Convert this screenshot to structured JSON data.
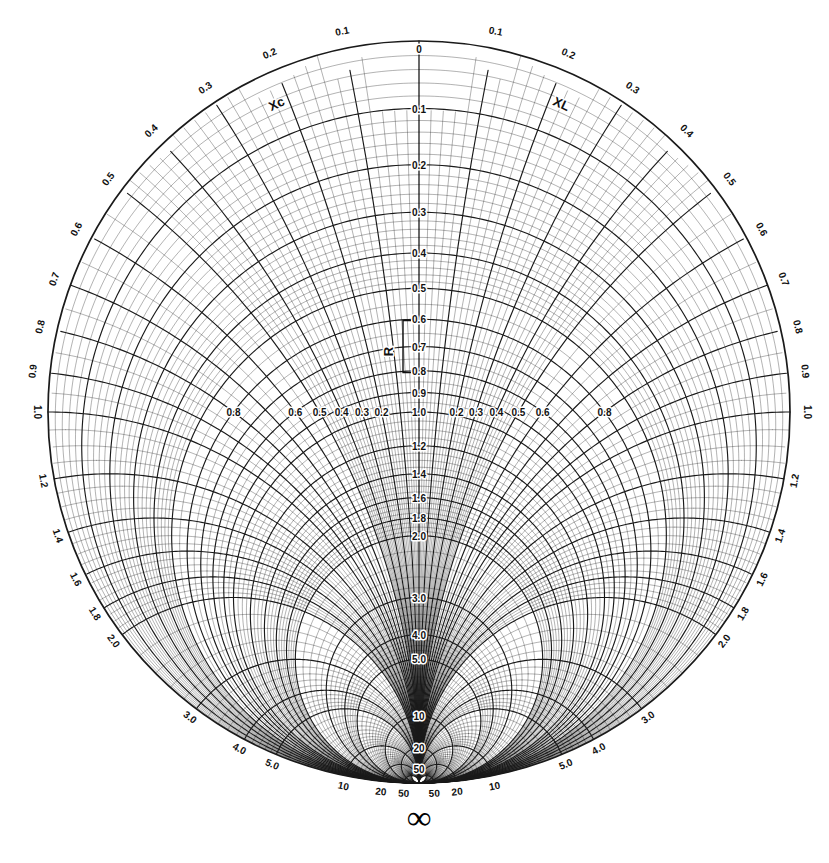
{
  "chart_data": {
    "type": "smith-chart",
    "orientation": "real axis vertical, 0 at top, infinity at bottom",
    "center": {
      "x": 419,
      "y": 412
    },
    "radius": 371,
    "axis_label_real": "R",
    "reactance_label_capacitive": "Xc",
    "reactance_label_inductive": "XL",
    "infinity_symbol": "∞",
    "perimeter_top_label": "0",
    "real_axis_ticks": [
      {
        "value": 0,
        "label": "0"
      },
      {
        "value": 0.1,
        "label": "0.1"
      },
      {
        "value": 0.2,
        "label": "0.2"
      },
      {
        "value": 0.3,
        "label": "0.3"
      },
      {
        "value": 0.4,
        "label": "0.4"
      },
      {
        "value": 0.5,
        "label": "0.5"
      },
      {
        "value": 0.6,
        "label": "0.6"
      },
      {
        "value": 0.7,
        "label": "0.7"
      },
      {
        "value": 0.8,
        "label": "0.8"
      },
      {
        "value": 0.9,
        "label": "0.9"
      },
      {
        "value": 1.0,
        "label": "1.0"
      },
      {
        "value": 1.2,
        "label": "1.2"
      },
      {
        "value": 1.4,
        "label": "1.4"
      },
      {
        "value": 1.6,
        "label": "1.6"
      },
      {
        "value": 1.8,
        "label": "1.8"
      },
      {
        "value": 2.0,
        "label": "2.0"
      },
      {
        "value": 3.0,
        "label": "3.0"
      },
      {
        "value": 4.0,
        "label": "4.0"
      },
      {
        "value": 5.0,
        "label": "5.0"
      },
      {
        "value": 10.0,
        "label": "10"
      },
      {
        "value": 20.0,
        "label": "20"
      },
      {
        "value": 50.0,
        "label": "50"
      }
    ],
    "perimeter_reactance_labels": [
      {
        "value": 0.1,
        "label": "0.1"
      },
      {
        "value": 0.2,
        "label": "0.2"
      },
      {
        "value": 0.3,
        "label": "0.3"
      },
      {
        "value": 0.4,
        "label": "0.4"
      },
      {
        "value": 0.5,
        "label": "0.5"
      },
      {
        "value": 0.6,
        "label": "0.6"
      },
      {
        "value": 0.7,
        "label": "0.7"
      },
      {
        "value": 0.8,
        "label": "0.8"
      },
      {
        "value": 0.9,
        "label": "0.9"
      },
      {
        "value": 1.0,
        "label": "1.0"
      },
      {
        "value": 1.2,
        "label": "1.2"
      },
      {
        "value": 1.4,
        "label": "1.4"
      },
      {
        "value": 1.6,
        "label": "1.6"
      },
      {
        "value": 1.8,
        "label": "1.8"
      },
      {
        "value": 2.0,
        "label": "2.0"
      },
      {
        "value": 3.0,
        "label": "3.0"
      },
      {
        "value": 4.0,
        "label": "4.0"
      },
      {
        "value": 5.0,
        "label": "5.0"
      },
      {
        "value": 10.0,
        "label": "10"
      },
      {
        "value": 20.0,
        "label": "20"
      },
      {
        "value": 50.0,
        "label": "50"
      }
    ],
    "interior_reactance_labels": [
      {
        "value": 0.2,
        "label": "0.2"
      },
      {
        "value": 0.3,
        "label": "0.3"
      },
      {
        "value": 0.4,
        "label": "0.4"
      },
      {
        "value": 0.5,
        "label": "0.5"
      },
      {
        "value": 0.6,
        "label": "0.6"
      },
      {
        "value": 0.8,
        "label": "0.8"
      },
      {
        "value": 1.0,
        "label": "1.0"
      }
    ],
    "resistance_circles_major": [
      0.1,
      0.2,
      0.3,
      0.4,
      0.5,
      0.6,
      0.7,
      0.8,
      0.9,
      1.0,
      1.2,
      1.4,
      1.6,
      1.8,
      2.0,
      3.0,
      4.0,
      5.0,
      10,
      20,
      50
    ],
    "reactance_arcs_major": [
      0.1,
      0.2,
      0.3,
      0.4,
      0.5,
      0.6,
      0.7,
      0.8,
      0.9,
      1.0,
      1.2,
      1.4,
      1.6,
      1.8,
      2.0,
      3.0,
      4.0,
      5.0,
      10,
      20,
      50
    ],
    "grid_color": "#1a1a1a",
    "background_color": "#ffffff",
    "grid": true,
    "legend": "none"
  }
}
